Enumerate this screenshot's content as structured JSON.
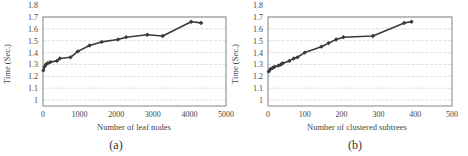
{
  "chart_data": [
    {
      "type": "line",
      "panel": "(a)",
      "title": "",
      "xlabel": "Number of leaf nodes",
      "ylabel": "Time (Sec.)",
      "xlim": [
        0,
        5000
      ],
      "ylim": [
        0.95,
        1.7
      ],
      "xticks": [
        "0",
        "1000",
        "2000",
        "3000",
        "4000",
        "5000"
      ],
      "yticks": [
        "1",
        "1.1",
        "1.2",
        "1.3",
        "1.4",
        "1.5",
        "1.6",
        "1.7",
        "1.8"
      ],
      "grid": true,
      "legend": null,
      "x": [
        10,
        40,
        80,
        130,
        200,
        380,
        460,
        750,
        950,
        1270,
        1600,
        2050,
        2270,
        2850,
        3270,
        4050,
        4320
      ],
      "y": [
        1.25,
        1.28,
        1.3,
        1.31,
        1.32,
        1.33,
        1.35,
        1.36,
        1.41,
        1.46,
        1.49,
        1.51,
        1.53,
        1.55,
        1.54,
        1.66,
        1.65
      ]
    },
    {
      "type": "line",
      "panel": "(b)",
      "title": "",
      "xlabel": "Number of clustered subtrees",
      "ylabel": "Time (Sec.)",
      "xlim": [
        0,
        500
      ],
      "ylim": [
        0.95,
        1.7
      ],
      "xticks": [
        "0",
        "100",
        "200",
        "300",
        "400",
        "500"
      ],
      "yticks": [
        "1",
        "1.1",
        "1.2",
        "1.3",
        "1.4",
        "1.5",
        "1.6",
        "1.7",
        "1.8"
      ],
      "grid": true,
      "legend": null,
      "x": [
        2,
        6,
        12,
        18,
        28,
        35,
        40,
        58,
        70,
        80,
        100,
        145,
        165,
        185,
        205,
        285,
        370,
        390
      ],
      "y": [
        1.24,
        1.26,
        1.27,
        1.28,
        1.29,
        1.3,
        1.31,
        1.33,
        1.35,
        1.36,
        1.4,
        1.45,
        1.48,
        1.51,
        1.53,
        1.54,
        1.65,
        1.66
      ]
    }
  ],
  "panels": {
    "a": {
      "caption": "(a)",
      "xlabel": "Number of leaf nodes",
      "ylabel": "Time (Sec.)"
    },
    "b": {
      "caption": "(b)",
      "xlabel": "Number of clustered subtrees",
      "ylabel": "Time (Sec.)"
    }
  }
}
